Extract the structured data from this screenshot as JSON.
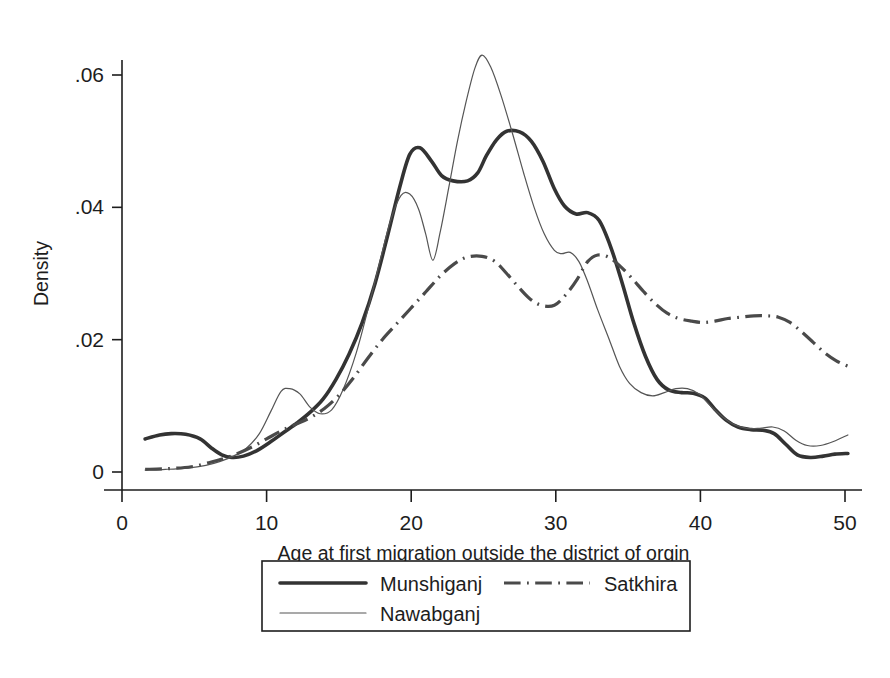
{
  "chart_data": {
    "type": "line",
    "title": "",
    "subtitle": "",
    "xlabel": "Age at first migration outside the district of orgin",
    "ylabel": "Density",
    "xlim": [
      0,
      51
    ],
    "ylim": [
      0,
      0.067
    ],
    "xticks": [
      0,
      10,
      20,
      30,
      40,
      50
    ],
    "xtick_labels": [
      "0",
      "10",
      "20",
      "30",
      "40",
      "50"
    ],
    "yticks": [
      0,
      0.02,
      0.04,
      0.06
    ],
    "ytick_labels": [
      "0",
      ".02",
      ".04",
      ".06"
    ],
    "grid": false,
    "legend_position": "below-axes",
    "series": [
      {
        "name": "Munshiganj",
        "style": "solid-thick",
        "color": "#333333",
        "width": 3.6,
        "points": [
          [
            1.6,
            0.005
          ],
          [
            2.6,
            0.0056
          ],
          [
            3.4,
            0.0058
          ],
          [
            4.4,
            0.0057
          ],
          [
            5.4,
            0.005
          ],
          [
            6.2,
            0.0036
          ],
          [
            6.9,
            0.0026
          ],
          [
            7.6,
            0.0022
          ],
          [
            8.4,
            0.0024
          ],
          [
            9.3,
            0.0032
          ],
          [
            10.3,
            0.0046
          ],
          [
            11.2,
            0.006
          ],
          [
            12.1,
            0.0074
          ],
          [
            13.0,
            0.009
          ],
          [
            13.9,
            0.011
          ],
          [
            14.8,
            0.014
          ],
          [
            15.7,
            0.0178
          ],
          [
            16.6,
            0.0225
          ],
          [
            17.5,
            0.0285
          ],
          [
            18.4,
            0.036
          ],
          [
            19.2,
            0.043
          ],
          [
            19.9,
            0.048
          ],
          [
            20.6,
            0.049
          ],
          [
            21.4,
            0.047
          ],
          [
            22.1,
            0.0448
          ],
          [
            22.9,
            0.044
          ],
          [
            23.9,
            0.044
          ],
          [
            24.6,
            0.0452
          ],
          [
            25.2,
            0.0478
          ],
          [
            25.9,
            0.0502
          ],
          [
            26.6,
            0.0515
          ],
          [
            27.5,
            0.0514
          ],
          [
            28.3,
            0.05
          ],
          [
            29.1,
            0.047
          ],
          [
            29.9,
            0.0428
          ],
          [
            30.6,
            0.0402
          ],
          [
            31.4,
            0.039
          ],
          [
            32.2,
            0.0392
          ],
          [
            33.0,
            0.038
          ],
          [
            33.8,
            0.034
          ],
          [
            34.6,
            0.0285
          ],
          [
            35.4,
            0.0225
          ],
          [
            36.2,
            0.0175
          ],
          [
            37.0,
            0.014
          ],
          [
            37.8,
            0.0124
          ],
          [
            38.7,
            0.012
          ],
          [
            39.5,
            0.0119
          ],
          [
            40.3,
            0.0112
          ],
          [
            41.0,
            0.0095
          ],
          [
            41.8,
            0.0078
          ],
          [
            42.6,
            0.0068
          ],
          [
            43.5,
            0.0064
          ],
          [
            44.3,
            0.0063
          ],
          [
            45.1,
            0.0058
          ],
          [
            45.9,
            0.0042
          ],
          [
            46.7,
            0.0026
          ],
          [
            47.6,
            0.0022
          ],
          [
            48.5,
            0.0024
          ],
          [
            49.3,
            0.0027
          ],
          [
            50.2,
            0.0028
          ]
        ]
      },
      {
        "name": "Nawabganj",
        "style": "solid-thin",
        "color": "#555555",
        "width": 1.2,
        "points": [
          [
            1.6,
            0.0003
          ],
          [
            3.0,
            0.0004
          ],
          [
            4.5,
            0.0006
          ],
          [
            5.8,
            0.001
          ],
          [
            6.8,
            0.0016
          ],
          [
            7.7,
            0.0024
          ],
          [
            8.6,
            0.0036
          ],
          [
            9.5,
            0.0058
          ],
          [
            10.3,
            0.0092
          ],
          [
            11.0,
            0.0122
          ],
          [
            11.6,
            0.0126
          ],
          [
            12.3,
            0.0118
          ],
          [
            13.0,
            0.0098
          ],
          [
            13.7,
            0.0088
          ],
          [
            14.5,
            0.0094
          ],
          [
            15.3,
            0.0125
          ],
          [
            16.2,
            0.018
          ],
          [
            17.0,
            0.0245
          ],
          [
            17.8,
            0.0315
          ],
          [
            18.6,
            0.0382
          ],
          [
            19.3,
            0.0418
          ],
          [
            19.9,
            0.042
          ],
          [
            20.5,
            0.0398
          ],
          [
            21.0,
            0.036
          ],
          [
            21.5,
            0.032
          ],
          [
            22.0,
            0.0362
          ],
          [
            22.6,
            0.043
          ],
          [
            23.2,
            0.05
          ],
          [
            23.8,
            0.056
          ],
          [
            24.4,
            0.061
          ],
          [
            24.9,
            0.063
          ],
          [
            25.5,
            0.0612
          ],
          [
            26.2,
            0.057
          ],
          [
            27.0,
            0.0512
          ],
          [
            27.8,
            0.045
          ],
          [
            28.5,
            0.04
          ],
          [
            29.2,
            0.036
          ],
          [
            29.9,
            0.0335
          ],
          [
            30.4,
            0.033
          ],
          [
            31.0,
            0.0332
          ],
          [
            31.6,
            0.0318
          ],
          [
            32.2,
            0.0288
          ],
          [
            32.9,
            0.0245
          ],
          [
            33.7,
            0.02
          ],
          [
            34.4,
            0.016
          ],
          [
            35.1,
            0.0134
          ],
          [
            35.9,
            0.012
          ],
          [
            36.7,
            0.0115
          ],
          [
            37.5,
            0.012
          ],
          [
            38.3,
            0.0126
          ],
          [
            39.1,
            0.0126
          ],
          [
            39.9,
            0.0118
          ],
          [
            40.7,
            0.01
          ],
          [
            41.5,
            0.0084
          ],
          [
            42.3,
            0.0072
          ],
          [
            43.2,
            0.0066
          ],
          [
            44.1,
            0.0066
          ],
          [
            45.0,
            0.0068
          ],
          [
            45.8,
            0.0062
          ],
          [
            46.6,
            0.0048
          ],
          [
            47.4,
            0.004
          ],
          [
            48.3,
            0.004
          ],
          [
            49.2,
            0.0046
          ],
          [
            50.2,
            0.0056
          ]
        ]
      },
      {
        "name": "Satkhira",
        "style": "dash-dot",
        "color": "#4a4a4a",
        "width": 3.2,
        "points": [
          [
            1.6,
            0.0004
          ],
          [
            3.2,
            0.0005
          ],
          [
            4.8,
            0.0008
          ],
          [
            6.0,
            0.0014
          ],
          [
            7.0,
            0.002
          ],
          [
            8.0,
            0.0028
          ],
          [
            9.0,
            0.0038
          ],
          [
            10.0,
            0.005
          ],
          [
            11.0,
            0.0062
          ],
          [
            12.0,
            0.0072
          ],
          [
            13.0,
            0.0082
          ],
          [
            14.0,
            0.0096
          ],
          [
            15.0,
            0.0116
          ],
          [
            16.0,
            0.0142
          ],
          [
            17.0,
            0.0172
          ],
          [
            18.0,
            0.02
          ],
          [
            19.0,
            0.0224
          ],
          [
            20.0,
            0.0248
          ],
          [
            21.0,
            0.0272
          ],
          [
            22.0,
            0.0296
          ],
          [
            23.0,
            0.0315
          ],
          [
            23.9,
            0.0325
          ],
          [
            24.9,
            0.0326
          ],
          [
            25.8,
            0.0318
          ],
          [
            26.6,
            0.03
          ],
          [
            27.4,
            0.028
          ],
          [
            28.2,
            0.0262
          ],
          [
            29.0,
            0.0252
          ],
          [
            29.9,
            0.0252
          ],
          [
            30.7,
            0.0268
          ],
          [
            31.5,
            0.0292
          ],
          [
            32.2,
            0.0318
          ],
          [
            32.9,
            0.0328
          ],
          [
            33.7,
            0.0324
          ],
          [
            34.5,
            0.031
          ],
          [
            35.3,
            0.0292
          ],
          [
            36.1,
            0.0272
          ],
          [
            36.9,
            0.0254
          ],
          [
            37.7,
            0.024
          ],
          [
            38.5,
            0.0232
          ],
          [
            39.4,
            0.0228
          ],
          [
            40.2,
            0.0226
          ],
          [
            41.0,
            0.0228
          ],
          [
            41.9,
            0.0232
          ],
          [
            42.8,
            0.0234
          ],
          [
            43.7,
            0.0236
          ],
          [
            44.6,
            0.0236
          ],
          [
            45.4,
            0.0234
          ],
          [
            46.2,
            0.0226
          ],
          [
            47.0,
            0.0212
          ],
          [
            47.8,
            0.0196
          ],
          [
            48.6,
            0.018
          ],
          [
            49.4,
            0.0168
          ],
          [
            50.2,
            0.016
          ]
        ]
      }
    ]
  },
  "axes": {
    "y_axis_title": "Density",
    "x_axis_title": "Age at first migration outside the district of orgin"
  },
  "legend": {
    "entries": [
      {
        "label": "Munshiganj",
        "style": "solid-thick"
      },
      {
        "label": "Satkhira",
        "style": "dash-dot"
      },
      {
        "label": "Nawabganj",
        "style": "solid-thin"
      }
    ]
  },
  "colors": {
    "axis": "#1d1d1d",
    "background": "#ffffff",
    "munshiganj": "#333333",
    "nawabganj": "#555555",
    "satkhira": "#4a4a4a"
  }
}
